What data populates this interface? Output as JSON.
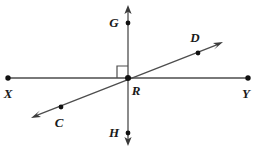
{
  "diagram": {
    "type": "geometry-line-diagram",
    "canvas": {
      "width": 255,
      "height": 147,
      "background": "#ffffff"
    },
    "style": {
      "line_color": "#4d4d4d",
      "point_color": "#111111",
      "label_color": "#1a1a1a",
      "stroke_width": 1.2,
      "point_radius": 2.4
    },
    "points": [
      {
        "id": "X",
        "label": "X",
        "x": 8,
        "y": 78,
        "label_x": 8,
        "label_y": 98,
        "kind": "endpoint"
      },
      {
        "id": "Y",
        "label": "Y",
        "x": 248,
        "y": 78,
        "label_x": 246,
        "label_y": 98,
        "kind": "endpoint"
      },
      {
        "id": "G",
        "label": "G",
        "x": 128,
        "y": 23,
        "label_x": 114,
        "label_y": 27,
        "kind": "point"
      },
      {
        "id": "H",
        "label": "H",
        "x": 128,
        "y": 133,
        "label_x": 114,
        "label_y": 137,
        "kind": "point"
      },
      {
        "id": "D",
        "label": "D",
        "x": 198,
        "y": 53,
        "label_x": 195,
        "label_y": 42,
        "kind": "point"
      },
      {
        "id": "C",
        "label": "C",
        "x": 61,
        "y": 107,
        "label_x": 59,
        "label_y": 127,
        "kind": "point"
      },
      {
        "id": "R",
        "label": "R",
        "x": 128,
        "y": 78,
        "label_x": 136,
        "label_y": 95,
        "kind": "intersection"
      }
    ],
    "lines": [
      {
        "id": "XY",
        "name": "line-xy",
        "from": "X",
        "to": "Y",
        "x1": 8,
        "y1": 78,
        "x2": 248,
        "y2": 78,
        "arrow_start": false,
        "arrow_end": false
      },
      {
        "id": "GH",
        "name": "line-gh",
        "x1": 128,
        "y1": 10,
        "x2": 128,
        "y2": 142,
        "arrow_start": true,
        "arrow_end": true
      },
      {
        "id": "CD",
        "name": "line-cd",
        "x1": 35,
        "y1": 116,
        "x2": 219,
        "y2": 44,
        "arrow_start": true,
        "arrow_end": true
      }
    ],
    "right_angle": {
      "at": "R",
      "name": "right-angle-mark",
      "quadrant": "upper-left",
      "x": 117,
      "y": 66,
      "size": 11,
      "measure_degrees": 90
    },
    "labels": {
      "X": "X",
      "Y": "Y",
      "G": "G",
      "H": "H",
      "C": "C",
      "D": "D",
      "R": "R"
    }
  }
}
